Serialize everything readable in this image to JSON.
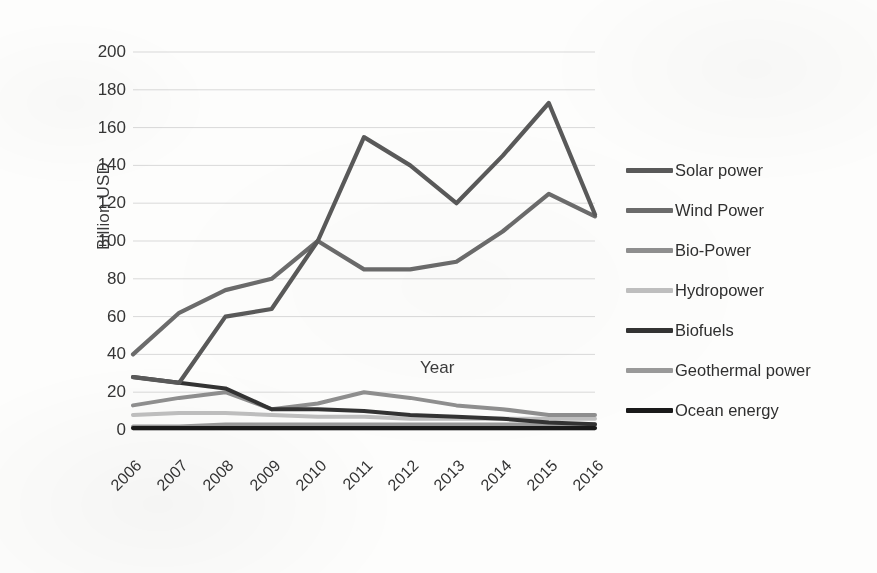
{
  "chart_data": {
    "type": "line",
    "title": "",
    "xlabel": "Year",
    "ylabel": "Billion USD",
    "categories": [
      "2006",
      "2007",
      "2008",
      "2009",
      "2010",
      "2011",
      "2012",
      "2013",
      "2014",
      "2015",
      "2016"
    ],
    "x": [
      2006,
      2007,
      2008,
      2009,
      2010,
      2011,
      2012,
      2013,
      2014,
      2015,
      2016
    ],
    "ylim": [
      0,
      200
    ],
    "yticks": [
      0,
      20,
      40,
      60,
      80,
      100,
      120,
      140,
      160,
      180,
      200
    ],
    "grid": true,
    "legend_position": "right",
    "series": [
      {
        "name": "Solar power",
        "color": "#595959",
        "values": [
          28,
          25,
          60,
          64,
          100,
          155,
          140,
          120,
          145,
          173,
          114
        ]
      },
      {
        "name": "Wind Power",
        "color": "#6b6b6b",
        "values": [
          40,
          62,
          74,
          80,
          100,
          85,
          85,
          89,
          105,
          125,
          113
        ]
      },
      {
        "name": "Bio-Power",
        "color": "#8f8f8f",
        "values": [
          13,
          17,
          20,
          11,
          14,
          20,
          17,
          13,
          11,
          8,
          8
        ]
      },
      {
        "name": "Hydropower",
        "color": "#bfbfbf",
        "values": [
          8,
          9,
          9,
          8,
          7,
          7,
          6,
          6,
          6,
          6,
          6
        ]
      },
      {
        "name": "Biofuels",
        "color": "#333333",
        "values": [
          28,
          25,
          22,
          11,
          11,
          10,
          8,
          7,
          6,
          4,
          3
        ]
      },
      {
        "name": "Geothermal power",
        "color": "#9a9a9a",
        "values": [
          2,
          2,
          3,
          3,
          3,
          3,
          3,
          3,
          3,
          3,
          3
        ]
      },
      {
        "name": "Ocean energy",
        "color": "#1a1a1a",
        "values": [
          1,
          1,
          1,
          1,
          1,
          1,
          1,
          1,
          1,
          1,
          1
        ]
      }
    ]
  },
  "legend": {
    "entries": [
      {
        "label": "Solar power"
      },
      {
        "label": "Wind Power"
      },
      {
        "label": "Bio-Power"
      },
      {
        "label": "Hydropower"
      },
      {
        "label": "Biofuels"
      },
      {
        "label": "Geothermal power"
      },
      {
        "label": "Ocean energy"
      }
    ]
  },
  "colors": {
    "background": "#fdfdfc",
    "gridline": "#d9d9d9",
    "text": "#333333"
  }
}
